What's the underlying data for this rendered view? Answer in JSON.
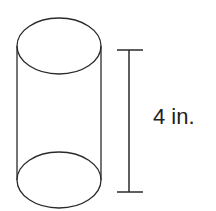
{
  "figure": {
    "shape": "cylinder",
    "dimension": {
      "label": "4 in.",
      "measures": "height"
    },
    "colors": {
      "stroke": "#2a2a2a",
      "background": "#ffffff"
    }
  }
}
